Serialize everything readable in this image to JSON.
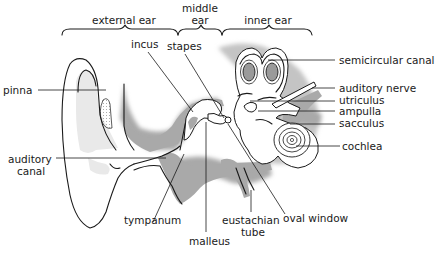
{
  "diagram": {
    "regions": {
      "external": "external ear",
      "middle_line1": "middle",
      "middle_line2": "ear",
      "inner": "inner ear"
    },
    "labels": {
      "pinna": "pinna",
      "auditory_canal_line1": "auditory",
      "auditory_canal_line2": "canal",
      "incus": "incus",
      "stapes": "stapes",
      "semicircular_canal": "semicircular canal",
      "auditory_nerve": "auditory nerve",
      "utriculus": "utriculus",
      "ampulla": "ampulla",
      "sacculus": "sacculus",
      "cochlea": "cochlea",
      "tympanum": "tympanum",
      "malleus": "malleus",
      "eustachian_tube_line1": "eustachian",
      "eustachian_tube_line2": "tube",
      "oval_window": "oval window"
    },
    "colors": {
      "line": "#1a1a1a",
      "shade": "#a9a9a9",
      "background": "#ffffff"
    }
  }
}
